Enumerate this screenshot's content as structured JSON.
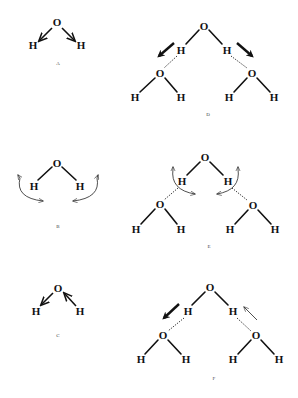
{
  "figure": {
    "panels": [
      {
        "id": "A",
        "label": "A",
        "type": "monomer",
        "mode": "symmetric stretch",
        "atoms": [
          "O",
          "H",
          "H"
        ]
      },
      {
        "id": "B",
        "label": "B",
        "type": "monomer",
        "mode": "bend",
        "atoms": [
          "O",
          "H",
          "H"
        ]
      },
      {
        "id": "C",
        "label": "C",
        "type": "monomer",
        "mode": "asymmetric stretch",
        "atoms": [
          "O",
          "H",
          "H"
        ]
      },
      {
        "id": "D",
        "label": "D",
        "type": "trimer",
        "mode": "symmetric stretch (H-bonded)",
        "atoms": [
          "O",
          "H",
          "H",
          "O",
          "H",
          "H",
          "O",
          "H",
          "H"
        ]
      },
      {
        "id": "E",
        "label": "E",
        "type": "trimer",
        "mode": "bend (H-bonded)",
        "atoms": [
          "O",
          "H",
          "H",
          "O",
          "H",
          "H",
          "O",
          "H",
          "H"
        ]
      },
      {
        "id": "F",
        "label": "F",
        "type": "trimer",
        "mode": "asymmetric stretch (H-bonded)",
        "atoms": [
          "O",
          "H",
          "H",
          "O",
          "H",
          "H",
          "O",
          "H",
          "H"
        ]
      }
    ]
  },
  "atoms": {
    "oxygen": "O",
    "hydrogen": "H"
  },
  "colors": {
    "ink": "#111111",
    "background": "#ffffff"
  }
}
